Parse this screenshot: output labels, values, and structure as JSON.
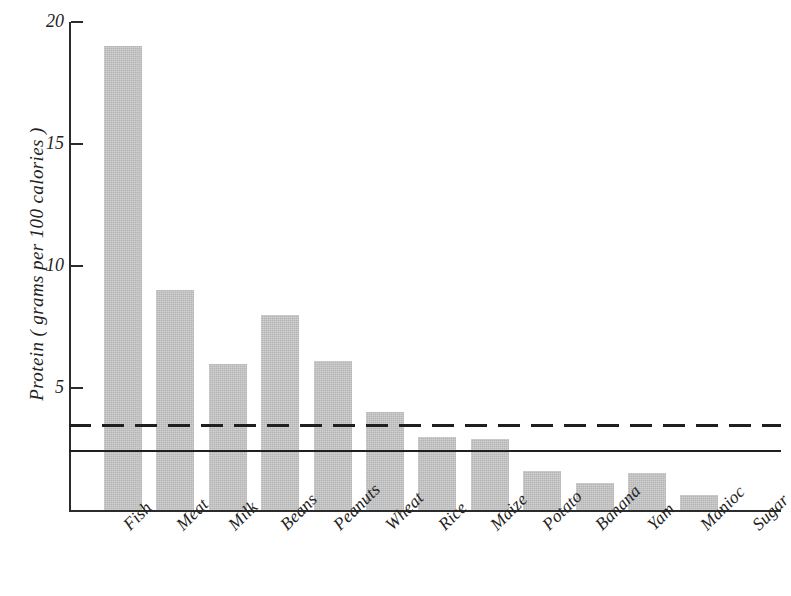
{
  "chart_data": {
    "type": "bar",
    "title": "",
    "subtitle": "",
    "xlabel": "",
    "ylabel": "Protein ( grams per 100 calories )",
    "categories": [
      "Fish",
      "Meat",
      "Milk",
      "Beans",
      "Peanuts",
      "Wheat",
      "Rice",
      "Maize",
      "Potato",
      "Banana",
      "Yam",
      "Manioc",
      "Sugar"
    ],
    "values": [
      19.0,
      9.0,
      6.0,
      8.0,
      6.1,
      4.0,
      3.0,
      2.9,
      1.6,
      1.1,
      1.5,
      0.6,
      0.0
    ],
    "ylim": [
      0,
      20
    ],
    "yticks": [
      5,
      10,
      15,
      20
    ],
    "ytick_labels": [
      "5",
      "10",
      "15",
      "20"
    ],
    "grid": false,
    "legend": "none",
    "bar_color": "#b5b5b5",
    "axis_color": "#2b2b2b",
    "annotations": [
      {
        "name": "upper-requirement-line",
        "type": "hline",
        "style": "dashed",
        "value": 3.5,
        "color": "#1f1f1f",
        "label": ""
      },
      {
        "name": "lower-requirement-line",
        "type": "hline",
        "style": "solid",
        "value": 2.4,
        "color": "#1f1f1f",
        "label": ""
      }
    ]
  },
  "axis": {
    "y_title": "Protein ( grams per 100 calories )"
  }
}
